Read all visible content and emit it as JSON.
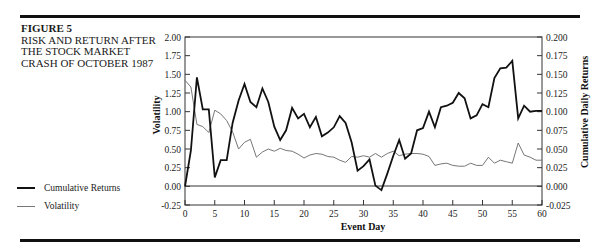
{
  "figure": {
    "number": "FIGURE 5",
    "caption_lines": [
      "RISK AND RETURN AFTER",
      "THE STOCK MARKET",
      "CRASH OF OCTOBER 1987"
    ]
  },
  "legend": {
    "items": [
      {
        "label": "Cumulative Returns",
        "color": "#111111",
        "style": "thick"
      },
      {
        "label": "Volatility",
        "color": "#777777",
        "style": "thin"
      }
    ]
  },
  "chart_data": {
    "type": "line",
    "title": "RISK AND RETURN AFTER THE STOCK MARKET CRASH OF OCTOBER 1987",
    "xlabel": "Event Day",
    "ylabel_left": "Volatility",
    "ylabel_right": "Cumulative Daily Returns",
    "xlim": [
      0,
      60
    ],
    "ylim_left": [
      -0.25,
      2.0
    ],
    "ylim_right": [
      -0.025,
      0.2
    ],
    "x_ticks": [
      0,
      5,
      10,
      15,
      20,
      25,
      30,
      35,
      40,
      45,
      50,
      55,
      60
    ],
    "y_ticks_left": [
      "2.00",
      "1.75",
      "1.50",
      "1.25",
      "1.00",
      "0.75",
      "0.50",
      "0.25",
      "0.00",
      "-0.25"
    ],
    "y_ticks_right": [
      "0.200",
      "0.175",
      "0.150",
      "0.125",
      "0.100",
      "0.075",
      "0.050",
      "0.025",
      "0.000",
      "-0.025"
    ],
    "grid": false,
    "legend_position": "left, outside plot",
    "x": [
      0,
      1,
      2,
      3,
      4,
      5,
      6,
      7,
      8,
      9,
      10,
      11,
      12,
      13,
      14,
      15,
      16,
      17,
      18,
      19,
      20,
      21,
      22,
      23,
      24,
      25,
      26,
      27,
      28,
      29,
      30,
      31,
      32,
      33,
      34,
      35,
      36,
      37,
      38,
      39,
      40,
      41,
      42,
      43,
      44,
      45,
      46,
      47,
      48,
      49,
      50,
      51,
      52,
      53,
      54,
      55,
      56,
      57,
      58,
      59,
      60
    ],
    "series": [
      {
        "name": "Cumulative Returns",
        "axis": "right",
        "note": "values plotted on left-axis scale (right axis = left/10)",
        "values": [
          0.0,
          0.48,
          1.46,
          1.03,
          1.03,
          0.12,
          0.35,
          0.35,
          0.85,
          1.15,
          1.37,
          1.13,
          1.06,
          1.31,
          1.13,
          0.8,
          0.62,
          0.75,
          1.05,
          0.91,
          0.97,
          0.79,
          0.93,
          0.67,
          0.72,
          0.79,
          0.94,
          0.85,
          0.59,
          0.21,
          0.27,
          0.36,
          0.01,
          -0.05,
          0.17,
          0.41,
          0.62,
          0.37,
          0.44,
          0.75,
          0.78,
          1.0,
          0.79,
          1.06,
          1.08,
          1.12,
          1.25,
          1.18,
          0.91,
          0.95,
          1.1,
          1.06,
          1.45,
          1.58,
          1.59,
          1.68,
          0.91,
          1.08,
          1.0,
          1.01,
          1.01
        ]
      },
      {
        "name": "Volatility",
        "axis": "left",
        "values": [
          1.42,
          1.33,
          0.83,
          0.8,
          0.72,
          1.02,
          0.97,
          0.88,
          0.73,
          0.5,
          0.59,
          0.63,
          0.39,
          0.46,
          0.5,
          0.47,
          0.51,
          0.48,
          0.47,
          0.43,
          0.38,
          0.42,
          0.44,
          0.43,
          0.4,
          0.39,
          0.35,
          0.32,
          0.4,
          0.39,
          0.41,
          0.39,
          0.44,
          0.39,
          0.44,
          0.47,
          0.41,
          0.43,
          0.44,
          0.44,
          0.43,
          0.4,
          0.28,
          0.3,
          0.31,
          0.28,
          0.27,
          0.27,
          0.31,
          0.28,
          0.28,
          0.39,
          0.31,
          0.35,
          0.33,
          0.31,
          0.58,
          0.42,
          0.39,
          0.35,
          0.35
        ]
      }
    ]
  }
}
